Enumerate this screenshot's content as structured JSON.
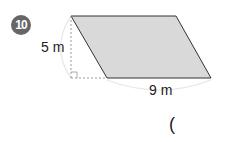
{
  "problem": {
    "number": "10",
    "height_label": "5 m",
    "base_label": "9 m",
    "answer_paren": "("
  },
  "shape": {
    "type": "parallelogram",
    "fill": "#d9d9d9",
    "stroke": "#333333",
    "vertices": [
      [
        71,
        16
      ],
      [
        176,
        16
      ],
      [
        211,
        78
      ],
      [
        107,
        78
      ]
    ]
  }
}
